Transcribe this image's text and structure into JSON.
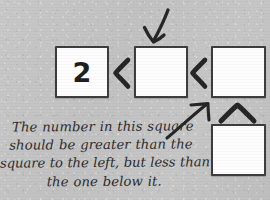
{
  "canvas": {
    "width": 270,
    "height": 200,
    "background_color": "#c3c3c3",
    "ink_color": "#2a2a2a",
    "cell_fill_color": "#fdfdfd",
    "cell_border_color": "#3c3c3c"
  },
  "cells": [
    {
      "id": "left",
      "value": "2",
      "filled": true,
      "row": "top",
      "column": 1
    },
    {
      "id": "middle",
      "value": "",
      "filled": false,
      "row": "top",
      "column": 2
    },
    {
      "id": "right",
      "value": "",
      "filled": false,
      "row": "top",
      "column": 3
    },
    {
      "id": "below",
      "value": "",
      "filled": false,
      "row": "bottom",
      "column": 3
    }
  ],
  "comparators": [
    {
      "id": "left-middle",
      "symbol": "<",
      "meaning": "left-square-less-than-middle-square"
    },
    {
      "id": "middle-right",
      "symbol": "<",
      "meaning": "middle-square-less-than-right-square"
    },
    {
      "id": "right-below",
      "symbol": "^",
      "meaning": "right-square-less-than-square-below"
    }
  ],
  "arrows": [
    {
      "id": "top",
      "direction": "down-left",
      "points_to": "middle-square"
    },
    {
      "id": "text",
      "direction": "up-right",
      "points_to": "middle-square"
    }
  ],
  "hint": {
    "full_text": "The number in this square should be greater than the square to the left, but less than the one below it.",
    "lines": [
      "The number in this square",
      "should be greater than the",
      "square to the left, but less than",
      "the one below it."
    ]
  }
}
